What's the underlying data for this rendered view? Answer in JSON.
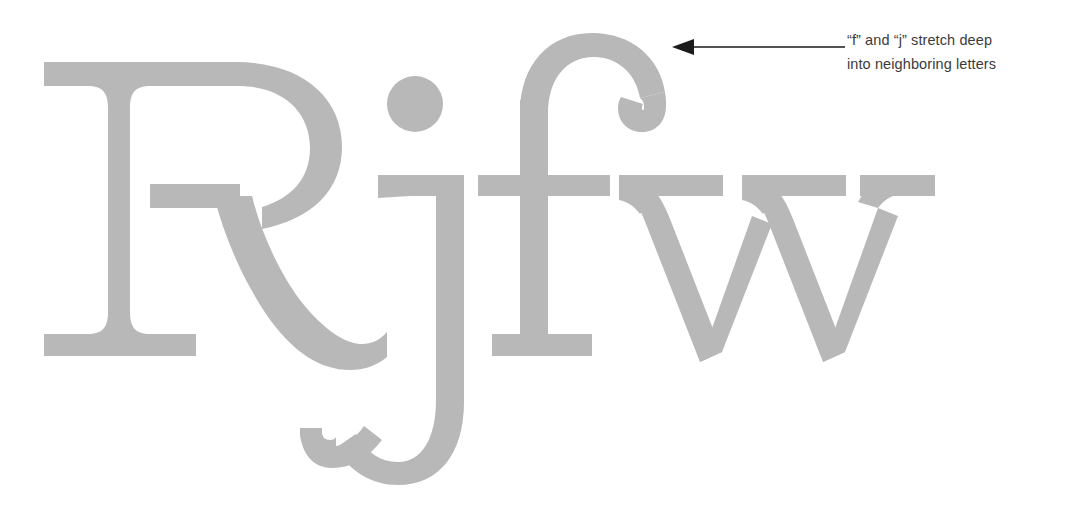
{
  "page": {
    "background_color": "#ffffff",
    "kind": "type-specimen"
  },
  "specimen": {
    "text": "Rjfw",
    "letters": [
      "R",
      "j",
      "f",
      "w"
    ],
    "glyph_color": "#b8b8b8",
    "style": "serif",
    "metrics": {
      "baseline_y": 355,
      "cap_top_y": 62,
      "x_height_top_y": 175,
      "ascender_top_y": 33,
      "descender_bottom_y": 483
    }
  },
  "callout": {
    "arrow": {
      "direction": "left",
      "color": "#1b1b1b",
      "tip_x": 672,
      "tail_x": 845,
      "y": 47
    },
    "lines": [
      "“f” and “j” stretch deep",
      "into neighboring letters"
    ],
    "text_color": "#3b3b3b"
  }
}
